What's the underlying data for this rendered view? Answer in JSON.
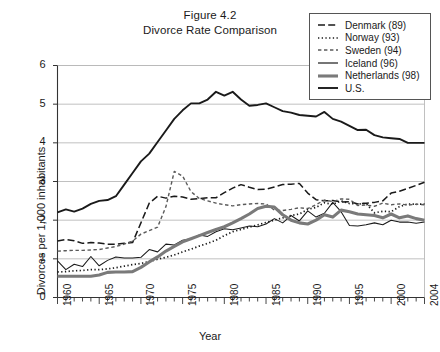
{
  "figure": {
    "title_line1": "Figure 4.2",
    "title_line2": "Divorce Rate Comparison"
  },
  "axes": {
    "ylabel": "Divorces per 1,000 inhabitants",
    "xlabel": "Year",
    "yticks": [
      "0",
      "1",
      "2",
      "3",
      "4",
      "5",
      "6"
    ],
    "xticks": [
      "1960",
      "1965",
      "1970",
      "1975",
      "1980",
      "1985",
      "1990",
      "1995",
      "2000",
      "2004"
    ]
  },
  "legend": {
    "items": [
      {
        "label": "Denmark (89)",
        "style": "dashed-long",
        "color": "#1a1a1a",
        "width": 1.4
      },
      {
        "label": "Norway (93)",
        "style": "dotted",
        "color": "#1a1a1a",
        "width": 1.4
      },
      {
        "label": "Sweden (94)",
        "style": "dashed-short",
        "color": "#555555",
        "width": 1.3
      },
      {
        "label": "Iceland (96)",
        "style": "solid",
        "color": "#1a1a1a",
        "width": 1.1
      },
      {
        "label": "Netherlands (98)",
        "style": "solid",
        "color": "#777777",
        "width": 3.0
      },
      {
        "label": "U.S.",
        "style": "solid",
        "color": "#1a1a1a",
        "width": 1.8
      }
    ]
  },
  "chart_data": {
    "type": "line",
    "title": "Divorce Rate Comparison",
    "xlabel": "Year",
    "ylabel": "Divorces per 1,000 inhabitants",
    "xlim": [
      1960,
      2004
    ],
    "ylim": [
      0,
      6
    ],
    "grid": true,
    "legend_position": "top-right",
    "x": [
      1960,
      1961,
      1962,
      1963,
      1964,
      1965,
      1966,
      1967,
      1968,
      1969,
      1970,
      1971,
      1972,
      1973,
      1974,
      1975,
      1976,
      1977,
      1978,
      1979,
      1980,
      1981,
      1982,
      1983,
      1984,
      1985,
      1986,
      1987,
      1988,
      1989,
      1990,
      1991,
      1992,
      1993,
      1994,
      1995,
      1996,
      1997,
      1998,
      1999,
      2000,
      2001,
      2002,
      2003,
      2004
    ],
    "series": [
      {
        "name": "Denmark (89)",
        "values": [
          1.46,
          1.5,
          1.47,
          1.4,
          1.42,
          1.41,
          1.38,
          1.38,
          1.4,
          1.42,
          1.93,
          2.44,
          2.62,
          2.57,
          2.62,
          2.6,
          2.54,
          2.56,
          2.58,
          2.58,
          2.71,
          2.83,
          2.92,
          2.85,
          2.79,
          2.8,
          2.86,
          2.92,
          2.93,
          2.95,
          2.7,
          2.53,
          2.5,
          2.51,
          2.47,
          2.48,
          2.42,
          2.44,
          2.46,
          2.5,
          2.7,
          2.75,
          2.82,
          2.9,
          2.98
        ],
        "style": "dashed-long"
      },
      {
        "name": "Norway (93)",
        "values": [
          0.66,
          0.67,
          0.69,
          0.7,
          0.72,
          0.72,
          0.74,
          0.77,
          0.81,
          0.85,
          0.88,
          0.93,
          0.99,
          1.04,
          1.1,
          1.18,
          1.25,
          1.33,
          1.4,
          1.48,
          1.6,
          1.7,
          1.76,
          1.82,
          1.88,
          1.94,
          2.0,
          2.06,
          2.12,
          2.16,
          2.28,
          2.33,
          2.45,
          2.41,
          2.5,
          2.43,
          2.42,
          2.43,
          2.19,
          2.23,
          2.22,
          2.35,
          2.42,
          2.41,
          2.42
        ],
        "style": "dotted"
      },
      {
        "name": "Sweden (94)",
        "values": [
          1.2,
          1.21,
          1.22,
          1.22,
          1.23,
          1.24,
          1.28,
          1.32,
          1.38,
          1.46,
          1.64,
          1.73,
          1.82,
          2.35,
          3.26,
          3.14,
          2.74,
          2.56,
          2.5,
          2.44,
          2.4,
          2.37,
          2.4,
          2.42,
          2.43,
          2.42,
          2.26,
          2.25,
          2.28,
          2.32,
          2.3,
          2.4,
          2.52,
          2.48,
          2.55,
          2.54,
          2.38,
          2.39,
          2.36,
          2.44,
          2.4,
          2.42,
          2.39,
          2.41,
          2.4
        ],
        "style": "dashed-short"
      },
      {
        "name": "Iceland (96)",
        "values": [
          0.95,
          0.72,
          0.86,
          0.8,
          1.06,
          0.82,
          0.96,
          1.05,
          1.02,
          1.02,
          1.04,
          1.24,
          1.18,
          1.38,
          1.36,
          1.48,
          1.52,
          1.62,
          1.58,
          1.7,
          1.78,
          1.75,
          1.8,
          1.85,
          1.83,
          1.9,
          2.04,
          1.93,
          2.12,
          1.98,
          2.24,
          2.08,
          2.18,
          2.46,
          2.22,
          1.86,
          1.85,
          1.88,
          1.93,
          1.88,
          2.0,
          1.95,
          1.95,
          1.92,
          1.95
        ],
        "style": "solid-thin"
      },
      {
        "name": "Netherlands (98)",
        "values": [
          0.55,
          0.55,
          0.55,
          0.55,
          0.55,
          0.58,
          0.65,
          0.66,
          0.66,
          0.67,
          0.78,
          0.92,
          1.05,
          1.2,
          1.32,
          1.44,
          1.52,
          1.6,
          1.68,
          1.76,
          1.83,
          1.93,
          2.04,
          2.16,
          2.3,
          2.36,
          2.34,
          2.14,
          2.0,
          1.93,
          1.9,
          2.0,
          2.14,
          2.08,
          2.26,
          2.22,
          2.16,
          2.14,
          2.12,
          2.06,
          2.16,
          2.06,
          2.11,
          2.04,
          2.0
        ],
        "style": "solid-thick"
      },
      {
        "name": "U.S.",
        "values": [
          2.2,
          2.28,
          2.22,
          2.3,
          2.42,
          2.5,
          2.52,
          2.62,
          2.92,
          3.22,
          3.52,
          3.72,
          4.02,
          4.32,
          4.62,
          4.84,
          5.02,
          5.02,
          5.12,
          5.32,
          5.22,
          5.32,
          5.12,
          4.96,
          4.98,
          5.02,
          4.92,
          4.82,
          4.78,
          4.72,
          4.7,
          4.68,
          4.8,
          4.62,
          4.55,
          4.44,
          4.33,
          4.34,
          4.2,
          4.14,
          4.12,
          4.1,
          4.0,
          4.0,
          4.0
        ],
        "style": "solid-us"
      }
    ]
  }
}
